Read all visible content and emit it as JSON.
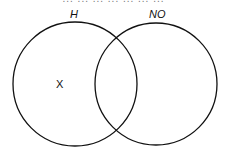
{
  "diagram": {
    "type": "venn",
    "cut_off_text": "... ... ... ... ... ... ...",
    "sets": [
      {
        "label": "H",
        "cx": 75,
        "cy": 84,
        "r": 62
      },
      {
        "label": "NO",
        "cx": 156,
        "cy": 84,
        "r": 61
      }
    ],
    "marks": [
      {
        "text": "X",
        "region": "H only"
      }
    ],
    "stroke_color": "#111111",
    "background": "#ffffff"
  }
}
